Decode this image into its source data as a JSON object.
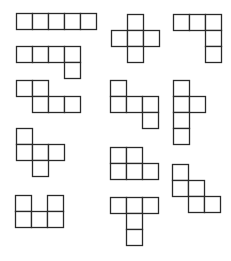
{
  "diagram": {
    "title": "",
    "background": "#ffffff",
    "stroke_color": "#2a2a2a",
    "cell_size": 16,
    "shapes": [
      {
        "name": "I-pentomino",
        "origin": [
          16,
          13
        ],
        "cells": [
          [
            0,
            0
          ],
          [
            1,
            0
          ],
          [
            2,
            0
          ],
          [
            3,
            0
          ],
          [
            4,
            0
          ]
        ]
      },
      {
        "name": "X-pentomino",
        "origin": [
          111,
          14
        ],
        "cells": [
          [
            1,
            0
          ],
          [
            0,
            1
          ],
          [
            1,
            1
          ],
          [
            2,
            1
          ],
          [
            1,
            2
          ]
        ]
      },
      {
        "name": "V-pentomino",
        "origin": [
          173,
          14
        ],
        "cells": [
          [
            0,
            0
          ],
          [
            1,
            0
          ],
          [
            2,
            0
          ],
          [
            2,
            1
          ],
          [
            2,
            2
          ]
        ]
      },
      {
        "name": "L-pentomino",
        "origin": [
          16,
          46
        ],
        "cells": [
          [
            0,
            0
          ],
          [
            1,
            0
          ],
          [
            2,
            0
          ],
          [
            3,
            0
          ],
          [
            3,
            1
          ]
        ]
      },
      {
        "name": "N-pentomino",
        "origin": [
          16,
          80
        ],
        "cells": [
          [
            0,
            0
          ],
          [
            1,
            0
          ],
          [
            1,
            1
          ],
          [
            2,
            1
          ],
          [
            3,
            1
          ]
        ]
      },
      {
        "name": "Z-pentomino",
        "origin": [
          110,
          80
        ],
        "cells": [
          [
            0,
            0
          ],
          [
            0,
            1
          ],
          [
            1,
            1
          ],
          [
            2,
            1
          ],
          [
            2,
            2
          ]
        ]
      },
      {
        "name": "Y-pentomino",
        "origin": [
          173,
          80
        ],
        "cells": [
          [
            0,
            0
          ],
          [
            0,
            1
          ],
          [
            1,
            1
          ],
          [
            0,
            2
          ],
          [
            0,
            3
          ]
        ]
      },
      {
        "name": "F-pentomino",
        "origin": [
          16,
          128
        ],
        "cells": [
          [
            0,
            0
          ],
          [
            0,
            1
          ],
          [
            1,
            1
          ],
          [
            2,
            1
          ],
          [
            1,
            2
          ]
        ]
      },
      {
        "name": "P-pentomino",
        "origin": [
          110,
          147
        ],
        "cells": [
          [
            0,
            0
          ],
          [
            1,
            0
          ],
          [
            0,
            1
          ],
          [
            1,
            1
          ],
          [
            2,
            1
          ]
        ]
      },
      {
        "name": "W-pentomino",
        "origin": [
          172,
          164
        ],
        "cells": [
          [
            0,
            0
          ],
          [
            0,
            1
          ],
          [
            1,
            1
          ],
          [
            1,
            2
          ],
          [
            2,
            2
          ]
        ]
      },
      {
        "name": "U-pentomino",
        "origin": [
          15,
          195
        ],
        "cells": [
          [
            0,
            0
          ],
          [
            2,
            0
          ],
          [
            0,
            1
          ],
          [
            1,
            1
          ],
          [
            2,
            1
          ]
        ]
      },
      {
        "name": "T-pentomino",
        "origin": [
          110,
          197
        ],
        "cells": [
          [
            0,
            0
          ],
          [
            1,
            0
          ],
          [
            2,
            0
          ],
          [
            1,
            1
          ],
          [
            1,
            2
          ]
        ]
      }
    ]
  }
}
